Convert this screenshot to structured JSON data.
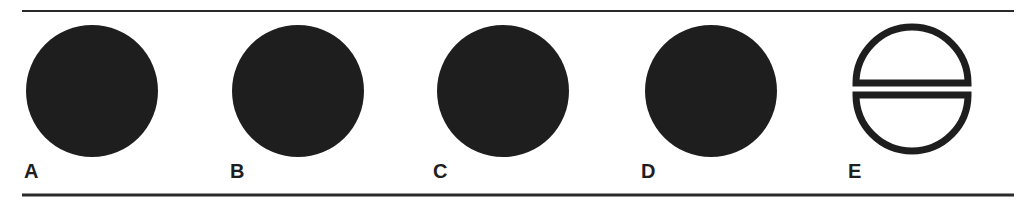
{
  "figure": {
    "panels": [
      {
        "label": "A",
        "shape": "filled-circle",
        "cx": 92,
        "cy": 91,
        "r": 66
      },
      {
        "label": "B",
        "shape": "filled-circle",
        "cx": 298,
        "cy": 91,
        "r": 66
      },
      {
        "label": "C",
        "shape": "filled-circle",
        "cx": 503,
        "cy": 91,
        "r": 66
      },
      {
        "label": "D",
        "shape": "filled-circle",
        "cx": 711,
        "cy": 91,
        "r": 66
      },
      {
        "label": "E",
        "shape": "split-circle-outline",
        "cx": 912,
        "cy": 89,
        "r": 60
      }
    ],
    "colors": {
      "ink": "#1e1e1e",
      "background": "#ffffff"
    }
  }
}
